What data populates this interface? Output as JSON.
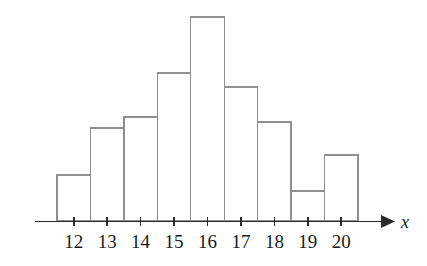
{
  "figure": {
    "title": "",
    "background_color": "#ffffff",
    "bar_stroke_color": "#8f8f8f",
    "bar_fill_color": "#ffffff",
    "axis_color": "#2b2b2b",
    "axis_name": "x",
    "arrow_icon": "right-arrow-icon"
  },
  "chart_data": {
    "type": "bar",
    "title": "",
    "subtitle": "",
    "xlabel": "x",
    "ylabel": "",
    "categories": [
      "12",
      "13",
      "14",
      "15",
      "16",
      "17",
      "18",
      "19",
      "20"
    ],
    "values": [
      46,
      93,
      104,
      148,
      204,
      134,
      99,
      30,
      66
    ],
    "tick_labels": [
      "12",
      "13",
      "14",
      "15",
      "16",
      "17",
      "18",
      "19",
      "20"
    ],
    "legend": [],
    "annotations": [],
    "grid": false,
    "legend_position": "none",
    "xlim": [
      11.5,
      20.5
    ],
    "ylim": [
      0,
      210
    ]
  }
}
